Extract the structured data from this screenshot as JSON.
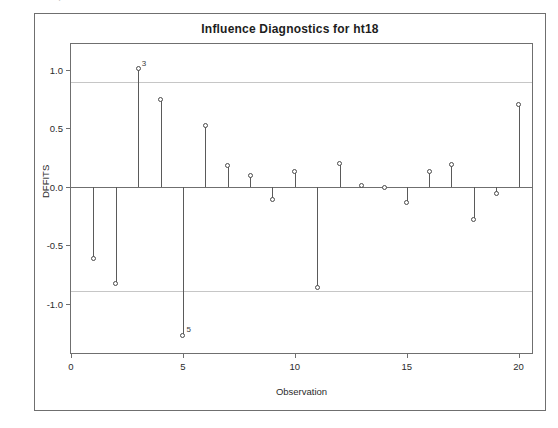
{
  "figure": {
    "title": "Influence Diagnostics for ht18",
    "ghost_text": "."
  },
  "axes": {
    "y_title": "DFFITS",
    "x_title": "Observation",
    "y_ticks": [
      "1.0",
      "0.5",
      "0.0",
      "-0.5",
      "-1.0"
    ],
    "y_tick_values": [
      1.0,
      0.5,
      0.0,
      -0.5,
      -1.0
    ],
    "x_ticks": [
      "0",
      "5",
      "10",
      "15",
      "20"
    ],
    "x_tick_values": [
      0,
      5,
      10,
      15,
      20
    ]
  },
  "colors": {
    "frame": "#6f6f6f",
    "stem": "#5a5a5a",
    "marker_edge": "#4a4a4a",
    "marker_fill": "#ffffff",
    "reference_line": "#c6c6c6",
    "zero_line": "#6f6f6f",
    "text": "#2b2b2b",
    "background": "#ffffff"
  },
  "chart_data": {
    "type": "scatter",
    "title": "Influence Diagnostics for ht18",
    "xlabel": "Observation",
    "ylabel": "DFFITS",
    "xlim": [
      0,
      20.6
    ],
    "ylim": [
      -1.42,
      1.22
    ],
    "grid": false,
    "legend": null,
    "style": "stem-and-marker (needle plot) from y = 0",
    "reference_lines": [
      0.894,
      -0.894
    ],
    "reference_line_label": "±2*sqrt(p/n) DFFITS cutoff",
    "x": [
      1,
      2,
      3,
      4,
      5,
      6,
      7,
      8,
      9,
      10,
      11,
      12,
      13,
      14,
      15,
      16,
      17,
      18,
      19,
      20
    ],
    "values": [
      -0.61,
      -0.83,
      1.01,
      0.75,
      -1.27,
      0.52,
      0.18,
      0.1,
      -0.11,
      0.13,
      -0.86,
      0.2,
      0.01,
      -0.01,
      -0.13,
      0.13,
      0.19,
      -0.28,
      -0.06,
      0.7
    ],
    "annotations": [
      {
        "x": 3,
        "y": 1.01,
        "label": "3"
      },
      {
        "x": 5,
        "y": -1.27,
        "label": "5"
      }
    ]
  }
}
